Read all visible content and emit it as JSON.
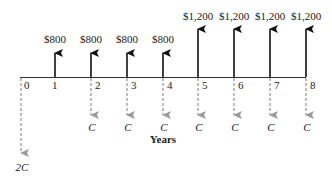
{
  "diagram": {
    "type": "cash-flow-diagram",
    "axis_label": "Years",
    "periods": [
      "0",
      "1",
      "2",
      "3",
      "4",
      "5",
      "6",
      "7",
      "8"
    ],
    "colors": {
      "inflow": "#111111",
      "outflow": "#9a9a9a",
      "axis": "#333333",
      "text": "#222222"
    },
    "inflows": [
      {
        "period": 1,
        "label": "$800"
      },
      {
        "period": 2,
        "label": "$800"
      },
      {
        "period": 3,
        "label": "$800"
      },
      {
        "period": 4,
        "label": "$800"
      },
      {
        "period": 5,
        "label": "$1,200"
      },
      {
        "period": 6,
        "label": "$1,200"
      },
      {
        "period": 7,
        "label": "$1,200"
      },
      {
        "period": 8,
        "label": "$1,200"
      }
    ],
    "outflows": [
      {
        "period": 0,
        "label": "2C"
      },
      {
        "period": 2,
        "label": "C"
      },
      {
        "period": 3,
        "label": "C"
      },
      {
        "period": 4,
        "label": "C"
      },
      {
        "period": 5,
        "label": "C"
      },
      {
        "period": 6,
        "label": "C"
      },
      {
        "period": 7,
        "label": "C"
      },
      {
        "period": 8,
        "label": "C"
      }
    ]
  }
}
